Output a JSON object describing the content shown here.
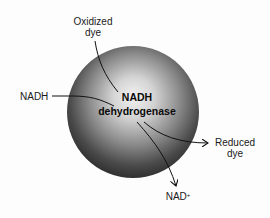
{
  "diagram": {
    "type": "enzyme-schematic",
    "enzyme": {
      "name_line1": "NADH",
      "name_line2": "dehydrogenase",
      "shape": "sphere",
      "fill_light": "#e8e8e8",
      "fill_dark": "#2a2a2a"
    },
    "labels": {
      "oxidized_dye_line1": "Oxidized",
      "oxidized_dye_line2": "dye",
      "nadh_input": "NADH",
      "reduced_dye_line1": "Reduced",
      "reduced_dye_line2": "dye",
      "nad_product": "NAD",
      "nad_superscript": "+"
    },
    "arrows": [
      {
        "from": "Oxidized dye",
        "to": "NADH dehydrogenase",
        "arrowhead": false
      },
      {
        "from": "NADH",
        "to": "NADH dehydrogenase",
        "arrowhead": false
      },
      {
        "from": "NADH dehydrogenase",
        "to": "Reduced dye",
        "arrowhead": true
      },
      {
        "from": "NADH dehydrogenase",
        "to": "NAD+",
        "arrowhead": true
      }
    ],
    "line_color": "#111111"
  }
}
